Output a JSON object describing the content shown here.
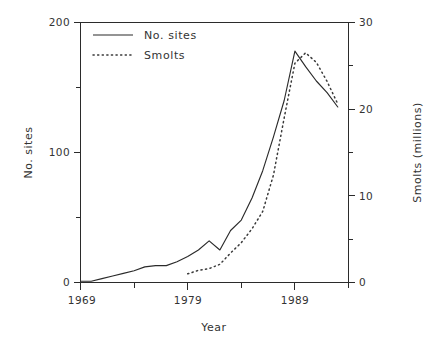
{
  "chart_data": {
    "type": "line",
    "title": "",
    "xlabel": "Year",
    "ylabel": "No. sites",
    "y2label": "Smolts (millions)",
    "xlim": [
      1969,
      1994
    ],
    "ylim": [
      0,
      200
    ],
    "y2lim": [
      0,
      30
    ],
    "grid": false,
    "legend_position": "top-left-inside",
    "x_ticks_major": [
      "1969",
      "1979",
      "1989"
    ],
    "x_tick_major_values": [
      1969,
      1979,
      1989
    ],
    "x_tick_minor_values": [
      1974,
      1984,
      1994
    ],
    "y_ticks_major": [
      "0",
      "100",
      "200"
    ],
    "y_tick_major_values": [
      0,
      100,
      200
    ],
    "y_tick_minor_values": [
      50,
      150
    ],
    "y2_ticks_major": [
      "0",
      "10",
      "20",
      "30"
    ],
    "y2_tick_major_values": [
      0,
      10,
      20,
      30
    ],
    "y2_tick_minor_values": [
      5,
      15,
      25
    ],
    "series": [
      {
        "name": "No. sites",
        "style": "solid",
        "axis": "left",
        "color": "#2b2b2b",
        "x": [
          1969,
          1970,
          1971,
          1972,
          1973,
          1974,
          1975,
          1976,
          1977,
          1978,
          1979,
          1980,
          1981,
          1982,
          1983,
          1984,
          1985,
          1986,
          1987,
          1988,
          1989,
          1990,
          1991,
          1992,
          1993
        ],
        "values": [
          1,
          1,
          3,
          5,
          7,
          9,
          12,
          13,
          13,
          16,
          20,
          25,
          32,
          25,
          40,
          48,
          65,
          86,
          112,
          140,
          178,
          166,
          155,
          146,
          135
        ]
      },
      {
        "name": "Smolts",
        "style": "dotted",
        "axis": "right",
        "color": "#3a3a3a",
        "x": [
          1979,
          1980,
          1981,
          1982,
          1983,
          1984,
          1985,
          1986,
          1987,
          1988,
          1989,
          1990,
          1991,
          1992,
          1993
        ],
        "values": [
          1.0,
          1.4,
          1.6,
          2.1,
          3.4,
          4.6,
          6.2,
          8.2,
          12.4,
          19.0,
          25.3,
          26.5,
          25.4,
          23.2,
          20.6
        ]
      }
    ],
    "legend_entries": [
      {
        "label": "No. sites",
        "style": "solid"
      },
      {
        "label": "Smolts",
        "style": "dotted"
      }
    ]
  },
  "labels": {
    "y_200": "200",
    "y_100": "100",
    "y_0": "0",
    "y2_30": "30",
    "y2_20": "20",
    "y2_10": "10",
    "y2_0": "0",
    "x_1969": "1969",
    "x_1979": "1979",
    "x_1989": "1989",
    "axis_x_title": "Year",
    "axis_y_title": "No. sites",
    "axis_y2_title": "Smolts (millions)",
    "legend_no_sites": "No. sites",
    "legend_smolts": "Smolts"
  }
}
